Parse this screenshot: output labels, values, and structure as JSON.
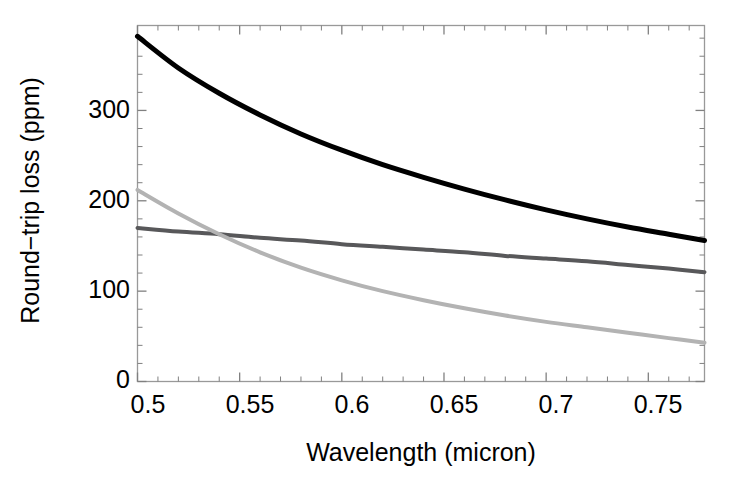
{
  "chart_data": {
    "type": "line",
    "title": "",
    "xlabel": "Wavelength (micron)",
    "ylabel": "Round−trip loss (ppm)",
    "xlim": [
      0.5,
      0.7775
    ],
    "ylim": [
      0,
      394
    ],
    "grid": false,
    "legend": "none",
    "xticks": [
      0.5,
      0.55,
      0.6,
      0.65,
      0.7,
      0.75
    ],
    "xtick_labels": [
      "0.5",
      "0.55",
      "0.6",
      "0.65",
      "0.7",
      "0.75"
    ],
    "yticks": [
      0,
      100,
      200,
      300
    ],
    "ytick_labels": [
      "0",
      "100",
      "200",
      "300"
    ],
    "x_minor_tick_step": 0.01,
    "y_minor_tick_step": 20,
    "x": [
      0.5,
      0.52,
      0.54,
      0.56,
      0.58,
      0.6,
      0.62,
      0.64,
      0.66,
      0.68,
      0.7,
      0.72,
      0.74,
      0.76,
      0.7775
    ],
    "series": [
      {
        "name": "upper-curve",
        "color": "#000000",
        "width": 5.0,
        "values": [
          382,
          347,
          319,
          295,
          274,
          256,
          240,
          226,
          213,
          201,
          190,
          180,
          171,
          163,
          156
        ]
      },
      {
        "name": "middle-curve",
        "color": "#58585a",
        "width": 4.0,
        "values": [
          170,
          166,
          163,
          159,
          156,
          152,
          149,
          146,
          143,
          139,
          136,
          133,
          129,
          125,
          121
        ]
      },
      {
        "name": "lower-curve",
        "color": "#b3b3b3",
        "width": 4.0,
        "values": [
          212,
          186,
          163,
          143,
          126,
          112,
          100,
          90,
          81,
          73,
          66,
          60,
          54,
          48,
          43
        ]
      }
    ],
    "annotations": [
      {
        "name": "curve-crossing",
        "x": 0.54,
        "y": 163,
        "between": [
          "middle-curve",
          "lower-curve"
        ]
      }
    ]
  },
  "axes": {
    "frame_color": "#999999",
    "background": "#ffffff",
    "tick_color": "#808080"
  }
}
